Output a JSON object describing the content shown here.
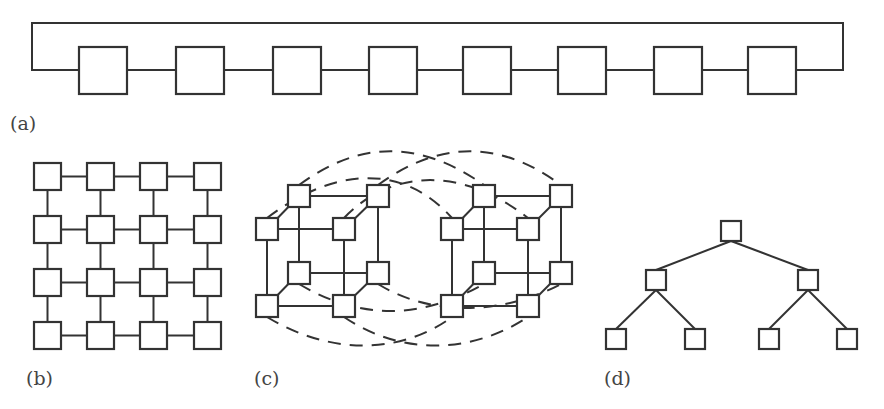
{
  "figure": {
    "panels": [
      {
        "id": "a",
        "label": "(a)",
        "topology": "ring",
        "node_count": 8,
        "nodes": [
          {
            "x": 79,
            "y": 47
          },
          {
            "x": 176,
            "y": 47
          },
          {
            "x": 273,
            "y": 47
          },
          {
            "x": 369,
            "y": 47
          },
          {
            "x": 463,
            "y": 47
          },
          {
            "x": 558,
            "y": 47
          },
          {
            "x": 654,
            "y": 47
          },
          {
            "x": 748,
            "y": 47
          }
        ],
        "node_size": [
          48,
          47
        ],
        "wraparound": {
          "left_x": 32,
          "right_x": 843,
          "top_y": 23,
          "row_y": 70
        }
      },
      {
        "id": "b",
        "label": "(b)",
        "topology": "2d-mesh",
        "rows": 4,
        "cols": 4,
        "col_x": [
          34,
          87,
          140,
          194
        ],
        "row_y": [
          163,
          216,
          269,
          322
        ],
        "node_size": 27
      },
      {
        "id": "c",
        "label": "(c)",
        "topology": "4d-hypercube",
        "node_count": 16,
        "node_size": 22,
        "cubes": [
          {
            "back": [
              [
                288,
                185
              ],
              [
                367,
                185
              ],
              [
                288,
                262
              ],
              [
                367,
                262
              ]
            ],
            "front": [
              [
                256,
                218
              ],
              [
                333,
                218
              ],
              [
                256,
                295
              ],
              [
                333,
                295
              ]
            ]
          },
          {
            "back": [
              [
                473,
                185
              ],
              [
                550,
                185
              ],
              [
                473,
                262
              ],
              [
                550,
                262
              ]
            ],
            "front": [
              [
                441,
                218
              ],
              [
                517,
                218
              ],
              [
                441,
                295
              ],
              [
                517,
                295
              ]
            ]
          }
        ],
        "cross_links_style": "dashed"
      },
      {
        "id": "d",
        "label": "(d)",
        "topology": "binary-tree",
        "levels": 3,
        "node_count": 7,
        "node_size": 20,
        "nodes": [
          {
            "x": 721,
            "y": 221,
            "parent": null
          },
          {
            "x": 646,
            "y": 270,
            "parent": 0
          },
          {
            "x": 798,
            "y": 270,
            "parent": 0
          },
          {
            "x": 606,
            "y": 329,
            "parent": 1
          },
          {
            "x": 685,
            "y": 329,
            "parent": 1
          },
          {
            "x": 759,
            "y": 329,
            "parent": 2
          },
          {
            "x": 837,
            "y": 329,
            "parent": 2
          }
        ]
      }
    ],
    "labels": {
      "a": "(a)",
      "b": "(b)",
      "c": "(c)",
      "d": "(d)"
    },
    "colors": {
      "stroke": "#333333",
      "fill": "#ffffff",
      "label": "#444444"
    }
  }
}
